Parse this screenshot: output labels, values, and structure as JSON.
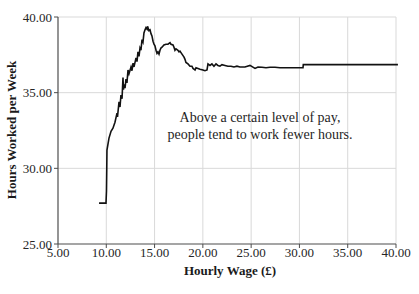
{
  "colors": {
    "background": "#ffffff",
    "gridline": "#d9d9d9",
    "axis": "#4d4d4d",
    "tick_text": "#262626",
    "line": "#121212"
  },
  "chart_data": {
    "type": "line",
    "title": "",
    "xlabel": "Hourly Wage (£)",
    "ylabel": "Hours Worked per Week",
    "xlim": [
      5,
      40
    ],
    "ylim": [
      25,
      40
    ],
    "grid": true,
    "legend": "none",
    "xtick_values": [
      5,
      10,
      15,
      20,
      25,
      30,
      35,
      40
    ],
    "xtick_labels": [
      "5.00",
      "10.00",
      "15.00",
      "20.00",
      "25.00",
      "30.00",
      "35.00",
      "40.00"
    ],
    "ytick_values": [
      25,
      30,
      35,
      40
    ],
    "ytick_labels": [
      "25.00",
      "30.00",
      "35.00",
      "40.00"
    ],
    "annotation": {
      "line1": "Above a certain level of pay,",
      "line2": "people tend to work fewer hours."
    },
    "series": [
      {
        "name": "hours-worked-vs-wage",
        "color": "#121212",
        "points": [
          [
            9.25,
            27.7
          ],
          [
            9.97,
            27.7
          ],
          [
            10.02,
            28.5
          ],
          [
            10.05,
            30.0
          ],
          [
            10.07,
            31.2
          ],
          [
            10.28,
            32.0
          ],
          [
            10.49,
            32.45
          ],
          [
            10.69,
            32.65
          ],
          [
            10.9,
            33.05
          ],
          [
            11.11,
            33.65
          ],
          [
            11.16,
            33.4
          ],
          [
            11.32,
            34.4
          ],
          [
            11.42,
            34.05
          ],
          [
            11.52,
            34.85
          ],
          [
            11.63,
            34.6
          ],
          [
            11.73,
            36.0
          ],
          [
            11.78,
            35.2
          ],
          [
            11.83,
            35.55
          ],
          [
            11.94,
            35.3
          ],
          [
            12.04,
            35.9
          ],
          [
            12.14,
            35.65
          ],
          [
            12.25,
            36.5
          ],
          [
            12.35,
            36.25
          ],
          [
            12.56,
            36.7
          ],
          [
            12.66,
            36.45
          ],
          [
            12.77,
            36.95
          ],
          [
            12.87,
            36.7
          ],
          [
            13.08,
            37.3
          ],
          [
            13.18,
            37.05
          ],
          [
            13.28,
            37.7
          ],
          [
            13.39,
            37.4
          ],
          [
            13.49,
            37.95
          ],
          [
            13.59,
            37.8
          ],
          [
            13.7,
            38.5
          ],
          [
            13.8,
            38.35
          ],
          [
            13.9,
            38.95
          ],
          [
            14.01,
            39.15
          ],
          [
            14.11,
            39.3
          ],
          [
            14.22,
            39.2
          ],
          [
            14.27,
            39.38
          ],
          [
            14.42,
            39.1
          ],
          [
            14.53,
            39.15
          ],
          [
            14.63,
            38.9
          ],
          [
            14.73,
            38.75
          ],
          [
            14.84,
            38.4
          ],
          [
            14.94,
            38.2
          ],
          [
            15.04,
            38.1
          ],
          [
            15.15,
            37.8
          ],
          [
            15.25,
            37.6
          ],
          [
            15.35,
            37.7
          ],
          [
            15.46,
            37.55
          ],
          [
            15.56,
            37.8
          ],
          [
            15.66,
            37.95
          ],
          [
            15.77,
            38.0
          ],
          [
            15.97,
            38.15
          ],
          [
            16.18,
            38.2
          ],
          [
            16.39,
            38.2
          ],
          [
            16.6,
            38.3
          ],
          [
            16.7,
            38.2
          ],
          [
            16.91,
            38.15
          ],
          [
            17.01,
            38.0
          ],
          [
            17.11,
            37.8
          ],
          [
            17.22,
            37.9
          ],
          [
            17.42,
            37.8
          ],
          [
            17.53,
            37.7
          ],
          [
            17.63,
            37.75
          ],
          [
            17.84,
            37.55
          ],
          [
            18.05,
            37.35
          ],
          [
            18.15,
            37.2
          ],
          [
            18.25,
            37.0
          ],
          [
            18.46,
            36.9
          ],
          [
            18.67,
            36.75
          ],
          [
            18.87,
            36.75
          ],
          [
            18.98,
            36.6
          ],
          [
            19.19,
            36.5
          ],
          [
            19.29,
            36.65
          ],
          [
            19.5,
            36.6
          ],
          [
            19.7,
            36.55
          ],
          [
            20.01,
            36.5
          ],
          [
            20.22,
            36.45
          ],
          [
            20.43,
            36.5
          ],
          [
            20.53,
            36.9
          ],
          [
            20.74,
            36.8
          ],
          [
            20.94,
            36.9
          ],
          [
            21.15,
            36.75
          ],
          [
            21.36,
            36.9
          ],
          [
            21.56,
            36.8
          ],
          [
            21.77,
            36.75
          ],
          [
            21.98,
            36.85
          ],
          [
            22.29,
            36.8
          ],
          [
            22.6,
            36.75
          ],
          [
            22.91,
            36.75
          ],
          [
            23.22,
            36.7
          ],
          [
            23.53,
            36.75
          ],
          [
            23.84,
            36.7
          ],
          [
            24.36,
            36.7
          ],
          [
            24.88,
            36.8
          ],
          [
            25.4,
            36.6
          ],
          [
            25.71,
            36.7
          ],
          [
            26.12,
            36.68
          ],
          [
            26.54,
            36.65
          ],
          [
            26.95,
            36.68
          ],
          [
            27.47,
            36.68
          ],
          [
            27.99,
            36.65
          ],
          [
            28.5,
            36.65
          ],
          [
            29.02,
            36.65
          ],
          [
            29.54,
            36.65
          ],
          [
            30.06,
            36.65
          ],
          [
            30.37,
            36.65
          ],
          [
            30.4,
            36.85
          ],
          [
            31.09,
            36.85
          ],
          [
            32.13,
            36.85
          ],
          [
            34.2,
            36.85
          ],
          [
            36.27,
            36.85
          ],
          [
            38.34,
            36.85
          ],
          [
            40.2,
            36.85
          ]
        ]
      }
    ]
  }
}
